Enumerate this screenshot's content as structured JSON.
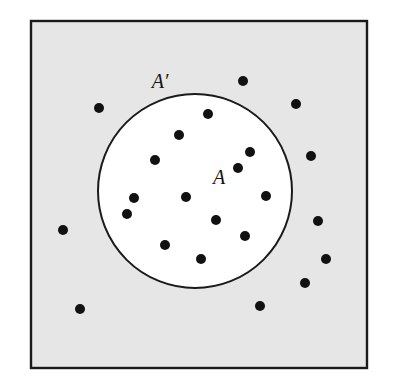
{
  "figure": {
    "kind": "set-venn-diagram",
    "canvas": {
      "width": 393,
      "height": 391,
      "background": "#ffffff"
    },
    "universe_rect": {
      "name": "universal-set-region",
      "x": 31,
      "y": 21,
      "width": 336,
      "height": 347,
      "fill": "#e6e6e6",
      "stroke": "#1a1a1a",
      "stroke_width": 2.4
    },
    "set_circle": {
      "name": "set-a-region",
      "cx": 195,
      "cy": 191,
      "r": 97,
      "fill": "#ffffff",
      "stroke": "#1a1a1a",
      "stroke_width": 2.0
    },
    "labels": [
      {
        "id": "label-a-prime",
        "text": "A′",
        "x": 160,
        "y": 88,
        "font_size": 20,
        "color": "#131313"
      },
      {
        "id": "label-a",
        "text": "A",
        "x": 219,
        "y": 184,
        "font_size": 20,
        "color": "#131313"
      }
    ],
    "point_style": {
      "radius": 5.0,
      "fill": "#111111"
    },
    "points_inside": [
      {
        "x": 208,
        "y": 114
      },
      {
        "x": 179,
        "y": 135
      },
      {
        "x": 250,
        "y": 152
      },
      {
        "x": 155,
        "y": 160
      },
      {
        "x": 186,
        "y": 197
      },
      {
        "x": 134,
        "y": 198
      },
      {
        "x": 266,
        "y": 196
      },
      {
        "x": 127,
        "y": 214
      },
      {
        "x": 216,
        "y": 220
      },
      {
        "x": 245,
        "y": 236
      },
      {
        "x": 165,
        "y": 245
      },
      {
        "x": 201,
        "y": 259
      },
      {
        "x": 238,
        "y": 168
      }
    ],
    "points_outside": [
      {
        "x": 243,
        "y": 81
      },
      {
        "x": 99,
        "y": 108
      },
      {
        "x": 296,
        "y": 104
      },
      {
        "x": 311,
        "y": 156
      },
      {
        "x": 326,
        "y": 259
      },
      {
        "x": 305,
        "y": 283
      },
      {
        "x": 260,
        "y": 306
      },
      {
        "x": 80,
        "y": 309
      },
      {
        "x": 318,
        "y": 221
      },
      {
        "x": 63,
        "y": 230
      }
    ],
    "counts": {
      "inside_label": "13",
      "outside_label": "10"
    }
  }
}
